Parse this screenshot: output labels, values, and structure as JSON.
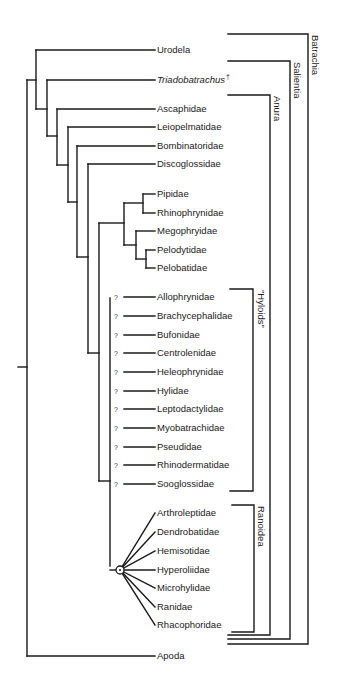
{
  "diagram": {
    "type": "cladogram",
    "title": "",
    "taxa": [
      {
        "name": "Urodela",
        "y": 50,
        "x_start": 36,
        "italic": false
      },
      {
        "name": "Triadobatrachus",
        "y": 80,
        "x_start": 47,
        "italic": true,
        "suffix": "†"
      },
      {
        "name": "Ascaphidae",
        "y": 109,
        "x_start": 57,
        "italic": false
      },
      {
        "name": "Leiopelmatidae",
        "y": 127,
        "x_start": 68,
        "italic": false
      },
      {
        "name": "Bombinatoridae",
        "y": 146,
        "x_start": 77,
        "italic": false
      },
      {
        "name": "Discoglossidae",
        "y": 164,
        "x_start": 88,
        "italic": false
      },
      {
        "name": "Pipidae",
        "y": 194,
        "x_start": 143,
        "italic": false
      },
      {
        "name": "Rhinophrynidae",
        "y": 213,
        "x_start": 143,
        "italic": false
      },
      {
        "name": "Megophryidae",
        "y": 231,
        "x_start": 136,
        "italic": false
      },
      {
        "name": "Pelodytidae",
        "y": 250,
        "x_start": 146,
        "italic": false
      },
      {
        "name": "Pelobatidae",
        "y": 268,
        "x_start": 146,
        "italic": false
      },
      {
        "name": "Allophrynidae",
        "y": 297,
        "x_start": 124,
        "uncertain": true
      },
      {
        "name": "Brachycephalidae",
        "y": 316,
        "x_start": 124,
        "uncertain": true
      },
      {
        "name": "Bufonidae",
        "y": 335,
        "x_start": 124,
        "uncertain": true
      },
      {
        "name": "Centrolenidae",
        "y": 353,
        "x_start": 124,
        "uncertain": true
      },
      {
        "name": "Heleophrynidae",
        "y": 372,
        "x_start": 124,
        "uncertain": true
      },
      {
        "name": "Hylidae",
        "y": 391,
        "x_start": 124,
        "uncertain": true
      },
      {
        "name": "Leptodactylidae",
        "y": 409,
        "x_start": 124,
        "uncertain": true
      },
      {
        "name": "Myobatrachidae",
        "y": 428,
        "x_start": 124,
        "uncertain": true
      },
      {
        "name": "Pseudidae",
        "y": 447,
        "x_start": 124,
        "uncertain": true
      },
      {
        "name": "Rhinodermatidae",
        "y": 465,
        "x_start": 124,
        "uncertain": true
      },
      {
        "name": "Sooglossidae",
        "y": 484,
        "x_start": 124,
        "uncertain": true
      },
      {
        "name": "Arthroleptidae",
        "y": 513,
        "radiating": true
      },
      {
        "name": "Dendrobatidae",
        "y": 532,
        "radiating": true
      },
      {
        "name": "Hemisotidae",
        "y": 551,
        "radiating": true
      },
      {
        "name": "Hyperoliidae",
        "y": 570,
        "radiating": true
      },
      {
        "name": "Microhylidae",
        "y": 588,
        "radiating": true
      },
      {
        "name": "Ranidae",
        "y": 607,
        "radiating": true
      },
      {
        "name": "Rhacophoridae",
        "y": 625,
        "radiating": true
      },
      {
        "name": "Apoda",
        "y": 656,
        "x_start": 27,
        "italic": false
      }
    ],
    "label_x": 157,
    "branch_end_x": 155,
    "uncertain_marker": "?",
    "polytomy_node": {
      "x": 120,
      "y": 570,
      "r": 4
    },
    "segments": [
      [
        18,
        367,
        27,
        367
      ],
      [
        27,
        80,
        27,
        656
      ],
      [
        27,
        80,
        36,
        80
      ],
      [
        36,
        50,
        36,
        109
      ],
      [
        36,
        109,
        47,
        109
      ],
      [
        47,
        80,
        47,
        136
      ],
      [
        47,
        136,
        57,
        136
      ],
      [
        57,
        109,
        57,
        165
      ],
      [
        57,
        165,
        68,
        165
      ],
      [
        68,
        127,
        68,
        202
      ],
      [
        68,
        202,
        77,
        202
      ],
      [
        77,
        146,
        77,
        257
      ],
      [
        77,
        257,
        88,
        257
      ],
      [
        88,
        164,
        88,
        353
      ],
      [
        88,
        353,
        99,
        353
      ],
      [
        99,
        223,
        99,
        481
      ],
      [
        99,
        481,
        110,
        481
      ],
      [
        99,
        223,
        124,
        223
      ],
      [
        124,
        203,
        124,
        245
      ],
      [
        124,
        203,
        143,
        203
      ],
      [
        143,
        194,
        143,
        213
      ],
      [
        124,
        245,
        136,
        245
      ],
      [
        136,
        231,
        136,
        259
      ],
      [
        136,
        259,
        146,
        259
      ],
      [
        146,
        250,
        146,
        268
      ],
      [
        110,
        298,
        110,
        566
      ],
      [
        110,
        570,
        116,
        570
      ]
    ],
    "groups": [
      {
        "name": "\"Hyloids\"",
        "x_from": 230,
        "x_bar": 253,
        "y_top": 289,
        "y_bottom": 491,
        "label_x": 258
      },
      {
        "name": "Ranoidea",
        "x_from": 232,
        "x_bar": 254,
        "y_top": 505,
        "y_bottom": 632,
        "label_x": 258
      },
      {
        "name": "Anura",
        "x_from": 228,
        "x_bar": 270,
        "y_top": 95,
        "y_bottom": 635,
        "label_x": 274
      },
      {
        "name": "Salientia",
        "x_from": 228,
        "x_bar": 290,
        "y_top": 61,
        "y_bottom": 639,
        "label_x": 294
      },
      {
        "name": "Batrachia",
        "x_from": 228,
        "x_bar": 308,
        "y_top": 34,
        "y_bottom": 644,
        "label_x": 312
      }
    ],
    "colors": {
      "line": "#1a1a1a",
      "background": "#ffffff"
    }
  }
}
